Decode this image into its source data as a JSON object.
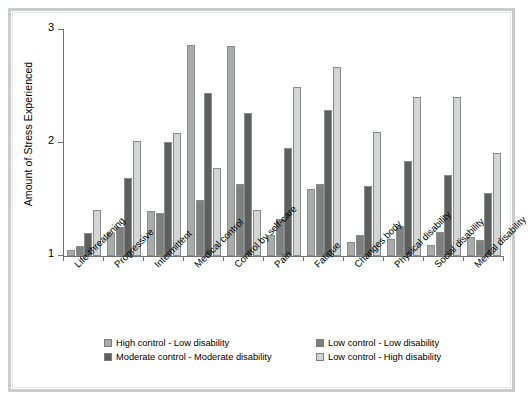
{
  "chart_data": {
    "type": "bar",
    "title": "",
    "xlabel": "",
    "ylabel": "Amount of Stress Experienced",
    "ylim": [
      1,
      3
    ],
    "yticks": [
      "1",
      "2",
      "3"
    ],
    "grid": false,
    "legend_position": "bottom",
    "categories": [
      "Life-threatening",
      "Progressive",
      "Intermittent",
      "Medical control",
      "Control by self-care",
      "Pain",
      "Fatigue",
      "Changes body",
      "Physical disability",
      "Social disability",
      "Mental disability"
    ],
    "series": [
      {
        "name": "High control - Low disability",
        "color": "#a8abaa",
        "values": [
          1.05,
          1.2,
          1.4,
          2.87,
          2.86,
          1.19,
          1.59,
          1.12,
          1.15,
          1.1,
          1.17
        ]
      },
      {
        "name": "Low control - Low disability",
        "color": "#7e8180",
        "values": [
          1.09,
          1.26,
          1.38,
          1.5,
          1.64,
          1.33,
          1.64,
          1.19,
          1.27,
          1.21,
          1.14
        ]
      },
      {
        "name": "Moderate control - Moderate disability",
        "color": "#5d605f",
        "values": [
          1.2,
          1.69,
          2.01,
          2.44,
          2.27,
          1.96,
          2.29,
          1.62,
          1.84,
          1.72,
          1.56
        ]
      },
      {
        "name": "Low control - High disability",
        "color": "#d2d5d4",
        "values": [
          1.41,
          2.02,
          2.09,
          1.78,
          1.41,
          2.5,
          2.67,
          2.1,
          2.41,
          2.41,
          1.91
        ]
      }
    ]
  },
  "legend": {
    "items": [
      {
        "label": "High control - Low disability",
        "color": "#a8abaa"
      },
      {
        "label": "Low control - Low disability",
        "color": "#7e8180"
      },
      {
        "label": "Moderate control - Moderate disability",
        "color": "#5d605f"
      },
      {
        "label": "Low control - High disability",
        "color": "#d2d5d4"
      }
    ]
  }
}
